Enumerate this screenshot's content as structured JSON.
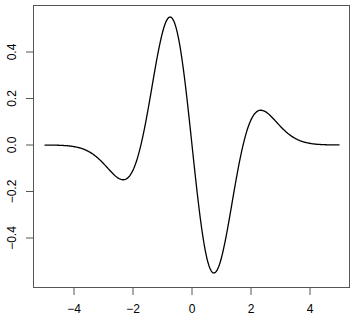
{
  "chart_data": {
    "type": "line",
    "title": "",
    "xlabel": "",
    "ylabel": "",
    "xlim": [
      -5.4,
      5.4
    ],
    "ylim": [
      -0.61,
      0.6
    ],
    "grid": false,
    "legend": null,
    "x_ticks": [
      -4,
      -2,
      0,
      2,
      4
    ],
    "x_tick_labels": [
      "−4",
      "−2",
      "0",
      "2",
      "4"
    ],
    "y_ticks": [
      -0.4,
      -0.2,
      0.0,
      0.2,
      0.4
    ],
    "y_tick_labels": [
      "−0.4",
      "−0.2",
      "0.0",
      "0.2",
      "0.4"
    ],
    "series": [
      {
        "name": "f(x)",
        "color": "#000000",
        "x": [
          -5,
          -4.75,
          -4.5,
          -4.25,
          -4,
          -3.75,
          -3.5,
          -3.25,
          -3,
          -2.75,
          -2.5,
          -2.25,
          -2,
          -1.75,
          -1.5,
          -1.25,
          -1,
          -0.75,
          -0.5,
          -0.25,
          0,
          0.25,
          0.5,
          0.75,
          1,
          1.25,
          1.5,
          1.75,
          2,
          2.25,
          2.5,
          2.75,
          3,
          3.25,
          3.5,
          3.75,
          4,
          4.25,
          4.5,
          4.75,
          5
        ],
        "y": [
          -0.0002,
          -0.0005,
          -0.0012,
          -0.0031,
          -0.007,
          -0.0146,
          -0.0283,
          -0.0499,
          -0.0798,
          -0.1141,
          -0.1424,
          -0.1473,
          -0.108,
          -0.0094,
          0.1457,
          0.3281,
          0.4839,
          0.5505,
          0.4841,
          0.284,
          0,
          -0.284,
          -0.4841,
          -0.5505,
          -0.4839,
          -0.3281,
          -0.1457,
          0.0094,
          0.108,
          0.1473,
          0.1424,
          0.1141,
          0.0798,
          0.0499,
          0.0283,
          0.0146,
          0.007,
          0.0031,
          0.0012,
          0.0005,
          0.0002
        ]
      }
    ]
  }
}
